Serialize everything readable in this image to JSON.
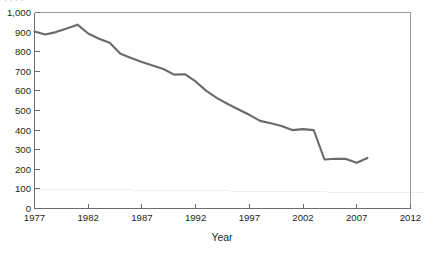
{
  "figure": {
    "cropped_top_text": "·  ·   ·     ·",
    "background_color": "#ffffff",
    "line_color": "#6b6a6a",
    "axis_color": "#6e6d6d",
    "frame_color": "#9a9999"
  },
  "chart_data": {
    "type": "line",
    "title": "",
    "subtitle": "",
    "xlabel": "Year",
    "ylabel": "",
    "xlim": [
      1977,
      2012
    ],
    "ylim": [
      0,
      1000
    ],
    "grid": false,
    "legend": "none",
    "xticks": [
      1977,
      1982,
      1987,
      1992,
      1997,
      2002,
      2007,
      2012
    ],
    "xtick_labels": [
      "1977",
      "1982",
      "1987",
      "1992",
      "1997",
      "2002",
      "2007",
      "2012"
    ],
    "yticks": [
      0,
      100,
      200,
      300,
      400,
      500,
      600,
      700,
      800,
      900,
      1000
    ],
    "ytick_labels": [
      "0",
      "100",
      "200",
      "300",
      "400",
      "500",
      "600",
      "700",
      "800",
      "900",
      "1,000"
    ],
    "series": [
      {
        "name": "series-1",
        "color": "#6b6a6a",
        "x": [
          1977,
          1978,
          1979,
          1980,
          1981,
          1982,
          1983,
          1984,
          1985,
          1986,
          1987,
          1988,
          1989,
          1990,
          1991,
          1992,
          1993,
          1994,
          1995,
          1996,
          1997,
          1998,
          1999,
          2000,
          2001,
          2002,
          2003,
          2004,
          2005,
          2006,
          2007,
          2008
        ],
        "values": [
          903,
          888,
          900,
          918,
          938,
          893,
          866,
          846,
          790,
          768,
          748,
          730,
          712,
          683,
          685,
          648,
          600,
          563,
          533,
          505,
          478,
          447,
          435,
          421,
          400,
          405,
          400,
          250,
          254,
          253,
          233,
          258
        ]
      }
    ]
  }
}
